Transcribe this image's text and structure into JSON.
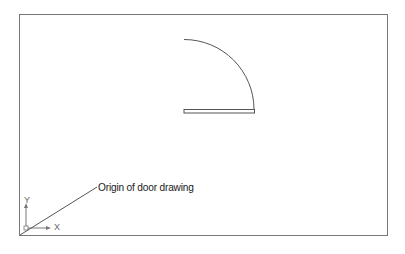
{
  "diagram": {
    "callout_text": "Origin of door drawing",
    "axis_labels": {
      "x": "X",
      "y": "Y"
    },
    "elements": [
      "frame",
      "door-swing-arc",
      "door-panel",
      "ucs-icon",
      "leader-line"
    ],
    "colors": {
      "line": "#555555",
      "frame": "#777777",
      "background": "#ffffff"
    }
  }
}
